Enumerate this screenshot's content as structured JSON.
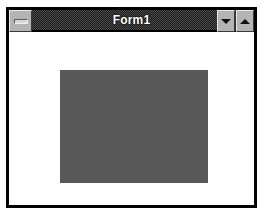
{
  "window": {
    "title": "Form1",
    "titlebar": {
      "system_menu": {
        "name": "system-menu-button",
        "glyph": "horizontal-bar"
      },
      "minimize": {
        "label": "▼",
        "glyph": "triangle-down"
      },
      "maximize": {
        "label": "▲",
        "glyph": "triangle-up"
      }
    },
    "client": {
      "shape": {
        "name": "gray-rectangle",
        "fill": "#585858",
        "shape_type": "rectangle"
      }
    },
    "colors": {
      "caption_background": "#1c1c1c",
      "caption_text": "#ffffff",
      "frame_border": "#000000",
      "client_background": "#ffffff",
      "button_face": "#b4b4b4",
      "shape_fill": "#585858"
    }
  },
  "desktop": {
    "background": "#ffffff"
  }
}
